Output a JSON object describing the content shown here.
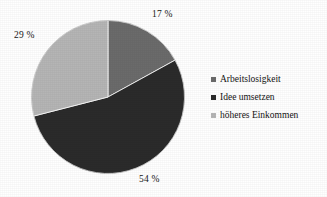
{
  "chart_data": {
    "type": "pie",
    "title": "",
    "subtitle": "",
    "xlabel": "",
    "ylabel": "",
    "grid": false,
    "legend_position": "right",
    "start_angle_deg": 0,
    "direction": "clockwise",
    "categories": [
      "Arbeitslosigkeit",
      "Idee umsetzen",
      "höheres Einkommen"
    ],
    "values": [
      17,
      54,
      29
    ],
    "unit": "%",
    "data_labels": [
      "17 %",
      "54 %",
      "29 %"
    ],
    "colors": [
      "#6b6b6b",
      "#2b2b2b",
      "#b5b5b5"
    ],
    "slices": [
      {
        "label": "Arbeitslosigkeit",
        "value": 17,
        "data_label": "17 %",
        "color": "#6b6b6b",
        "start_deg": 0.0,
        "end_deg": 61.2
      },
      {
        "label": "Idee umsetzen",
        "value": 54,
        "data_label": "54 %",
        "color": "#2b2b2b",
        "start_deg": 61.2,
        "end_deg": 255.6
      },
      {
        "label": "höheres Einkommen",
        "value": 29,
        "data_label": "29 %",
        "color": "#b5b5b5",
        "start_deg": 255.6,
        "end_deg": 360.0
      }
    ]
  },
  "legend": {
    "items": [
      {
        "label": "Arbeitslosigkeit",
        "color": "#6b6b6b"
      },
      {
        "label": "Idee umsetzen",
        "color": "#2b2b2b"
      },
      {
        "label": "höheres Einkommen",
        "color": "#b5b5b5"
      }
    ]
  },
  "background_color": "#ffffff"
}
